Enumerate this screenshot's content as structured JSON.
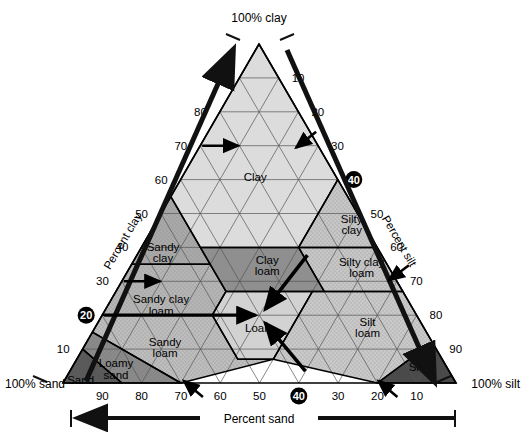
{
  "figure": {
    "kind": "soil-texture-triangle",
    "apex_label": "100% clay",
    "left_corner_label": "100% sand",
    "right_corner_label": "100% silt",
    "axis_titles": {
      "left": "Percent clay",
      "right": "Percent silt",
      "bottom": "Percent sand"
    }
  },
  "axes": {
    "clay": {
      "title": "Percent clay",
      "direction": "upward-left-side",
      "ticks": [
        "10",
        "20",
        "30",
        "40",
        "50",
        "60",
        "70",
        "80",
        "90"
      ],
      "highlighted_tick": "20"
    },
    "silt": {
      "title": "Percent silt",
      "direction": "downward-right-side",
      "ticks": [
        "10",
        "20",
        "30",
        "40",
        "50",
        "60",
        "70",
        "80",
        "90"
      ],
      "highlighted_tick": "40"
    },
    "sand": {
      "title": "Percent sand",
      "direction": "right-to-left-bottom",
      "ticks": [
        "90",
        "80",
        "70",
        "60",
        "50",
        "40",
        "30",
        "20",
        "10"
      ],
      "highlighted_tick": "40"
    }
  },
  "highlighted_reading": {
    "clay": "20",
    "silt": "40",
    "sand": "40",
    "result_class": "Loam"
  },
  "classes": [
    {
      "name": "Clay",
      "label_lines": [
        "Clay"
      ],
      "fill": "#dcdcdc"
    },
    {
      "name": "Silty clay",
      "label_lines": [
        "Silty",
        "clay"
      ],
      "fill": "#c6c6c6"
    },
    {
      "name": "Sandy clay",
      "label_lines": [
        "Sandy",
        "clay"
      ],
      "fill": "#a9a9a9"
    },
    {
      "name": "Clay loam",
      "label_lines": [
        "Clay",
        "loam"
      ],
      "fill": "#8f8f8f"
    },
    {
      "name": "Silty clay loam",
      "label_lines": [
        "Silty clay",
        "loam"
      ],
      "fill": "#c6c6c6"
    },
    {
      "name": "Sandy clay loam",
      "label_lines": [
        "Sandy clay",
        "loam"
      ],
      "fill": "#b5b5b5"
    },
    {
      "name": "Loam",
      "label_lines": [
        "Loam"
      ],
      "fill": "#d2d2d2"
    },
    {
      "name": "Silt loam",
      "label_lines": [
        "Silt",
        "loam"
      ],
      "fill": "#c9c9c9"
    },
    {
      "name": "Silt",
      "label_lines": [
        "Silt"
      ],
      "fill": "#4a4a4a"
    },
    {
      "name": "Sandy loam",
      "label_lines": [
        "Sandy",
        "loam"
      ],
      "fill": "#bdbdbd"
    },
    {
      "name": "Loamy sand",
      "label_lines": [
        "Loamy",
        "sand"
      ],
      "fill": "#8a8a8a"
    },
    {
      "name": "Sand",
      "label_lines": [
        "Sand"
      ],
      "fill": "#5a5a5a"
    }
  ],
  "chart_data": {
    "type": "ternary-classification",
    "components": [
      "Percent sand",
      "Percent silt",
      "Percent clay"
    ],
    "axis_range": [
      0,
      100
    ],
    "tick_step": 10,
    "grid": true,
    "legend": "none",
    "reading_lines": [
      {
        "axis": "clay",
        "value": 20
      },
      {
        "axis": "silt",
        "value": 40
      },
      {
        "axis": "sand",
        "value": 40
      }
    ],
    "reading_result": "Loam",
    "regions": [
      {
        "name": "Clay",
        "vertices_sand_silt_clay": [
          [
            0,
            0,
            100
          ],
          [
            45,
            0,
            55
          ],
          [
            45,
            15,
            40
          ],
          [
            20,
            40,
            40
          ],
          [
            0,
            40,
            60
          ]
        ]
      },
      {
        "name": "Silty clay",
        "vertices_sand_silt_clay": [
          [
            0,
            40,
            60
          ],
          [
            20,
            40,
            40
          ],
          [
            0,
            60,
            40
          ]
        ]
      },
      {
        "name": "Sandy clay",
        "vertices_sand_silt_clay": [
          [
            45,
            0,
            55
          ],
          [
            65,
            0,
            35
          ],
          [
            45,
            20,
            35
          ]
        ]
      },
      {
        "name": "Clay loam",
        "vertices_sand_silt_clay": [
          [
            20,
            40,
            40
          ],
          [
            45,
            15,
            40
          ],
          [
            45,
            28,
            27
          ],
          [
            20,
            53,
            27
          ]
        ]
      },
      {
        "name": "Silty clay loam",
        "vertices_sand_silt_clay": [
          [
            0,
            60,
            40
          ],
          [
            20,
            40,
            40
          ],
          [
            20,
            53,
            27
          ],
          [
            0,
            73,
            27
          ]
        ]
      },
      {
        "name": "Sandy clay loam",
        "vertices_sand_silt_clay": [
          [
            45,
            20,
            35
          ],
          [
            65,
            0,
            35
          ],
          [
            80,
            0,
            20
          ],
          [
            52,
            28,
            20
          ],
          [
            45,
            28,
            27
          ]
        ]
      },
      {
        "name": "Loam",
        "vertices_sand_silt_clay": [
          [
            45,
            28,
            27
          ],
          [
            52,
            28,
            20
          ],
          [
            52,
            41,
            7
          ],
          [
            43,
            50,
            7
          ],
          [
            23,
            50,
            27
          ]
        ]
      },
      {
        "name": "Silt loam",
        "vertices_sand_silt_clay": [
          [
            0,
            73,
            27
          ],
          [
            23,
            50,
            27
          ],
          [
            43,
            50,
            7
          ],
          [
            20,
            80,
            0
          ],
          [
            0,
            88,
            12
          ]
        ]
      },
      {
        "name": "Silt",
        "vertices_sand_silt_clay": [
          [
            0,
            88,
            12
          ],
          [
            20,
            80,
            0
          ],
          [
            0,
            100,
            0
          ]
        ]
      },
      {
        "name": "Sandy loam",
        "vertices_sand_silt_clay": [
          [
            52,
            28,
            20
          ],
          [
            80,
            0,
            20
          ],
          [
            85,
            0,
            15
          ],
          [
            70,
            30,
            0
          ],
          [
            43,
            50,
            7
          ],
          [
            52,
            41,
            7
          ]
        ]
      },
      {
        "name": "Loamy sand",
        "vertices_sand_silt_clay": [
          [
            85,
            0,
            15
          ],
          [
            90,
            0,
            10
          ],
          [
            85,
            15,
            0
          ],
          [
            70,
            30,
            0
          ]
        ]
      },
      {
        "name": "Sand",
        "vertices_sand_silt_clay": [
          [
            90,
            0,
            10
          ],
          [
            100,
            0,
            0
          ],
          [
            85,
            15,
            0
          ]
        ]
      }
    ]
  }
}
